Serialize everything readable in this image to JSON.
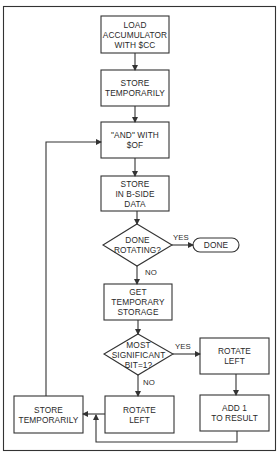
{
  "diagram": {
    "type": "flowchart",
    "colors": {
      "stroke": "#333333",
      "background": "#ffffff",
      "text": "#2a2a2a"
    },
    "nodes": {
      "load": {
        "shape": "rect",
        "label": "LOAD\nACCUMULATOR\nWITH $CC"
      },
      "store1": {
        "shape": "rect",
        "label": "STORE\nTEMPORARILY"
      },
      "and": {
        "shape": "rect",
        "label": "\"AND\" WITH\n$OF"
      },
      "storeb": {
        "shape": "rect",
        "label": "STORE\nIN B-SIDE\nDATA"
      },
      "done_rot": {
        "shape": "diamond",
        "label": "DONE\nROTATING?"
      },
      "done": {
        "shape": "terminal",
        "label": "DONE"
      },
      "get": {
        "shape": "rect",
        "label": "GET\nTEMPORARY\nSTORAGE"
      },
      "msb": {
        "shape": "diamond",
        "label": "MOST\nSIGNIFICANT\nBIT=1?"
      },
      "rot_right": {
        "shape": "rect",
        "label": "ROTATE\nLEFT"
      },
      "add1": {
        "shape": "rect",
        "label": "ADD 1\nTO RESULT"
      },
      "rot_bottom": {
        "shape": "rect",
        "label": "ROTATE\nLEFT"
      },
      "store2": {
        "shape": "rect",
        "label": "STORE\nTEMPORARILY"
      }
    },
    "edge_labels": {
      "done_yes": "YES",
      "done_no": "NO",
      "msb_yes": "YES",
      "msb_no": "NO"
    },
    "edges": [
      [
        "load",
        "store1"
      ],
      [
        "store1",
        "and"
      ],
      [
        "and",
        "storeb"
      ],
      [
        "storeb",
        "done_rot"
      ],
      [
        "done_rot",
        "done",
        "YES"
      ],
      [
        "done_rot",
        "get",
        "NO"
      ],
      [
        "get",
        "msb"
      ],
      [
        "msb",
        "rot_right",
        "YES"
      ],
      [
        "msb",
        "rot_bottom",
        "NO"
      ],
      [
        "rot_right",
        "add1"
      ],
      [
        "add1",
        "store2"
      ],
      [
        "rot_bottom",
        "store2"
      ],
      [
        "store2",
        "and"
      ]
    ]
  }
}
